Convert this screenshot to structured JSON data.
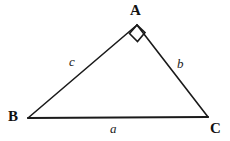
{
  "figure": {
    "kind": "right-triangle-diagram",
    "background_color": "#ffffff",
    "stroke_color": "#1a1a1a",
    "label_color": "#111111",
    "width": 230,
    "height": 141,
    "vertices": [
      {
        "name": "A",
        "label": "A",
        "x": 137,
        "y": 25,
        "angle": "right"
      },
      {
        "name": "B",
        "label": "B",
        "x": 28,
        "y": 118,
        "angle": "acute"
      },
      {
        "name": "C",
        "label": "C",
        "x": 208,
        "y": 117,
        "angle": "acute"
      }
    ],
    "sides": [
      {
        "name": "a",
        "label": "a",
        "from": "B",
        "to": "C",
        "role": "hypotenuse",
        "stroke_width": 2.2
      },
      {
        "name": "b",
        "label": "b",
        "from": "A",
        "to": "C",
        "role": "leg",
        "stroke_width": 1.6
      },
      {
        "name": "c",
        "label": "c",
        "from": "B",
        "to": "A",
        "role": "leg",
        "stroke_width": 1.6
      }
    ],
    "right_angle_marker": {
      "at_vertex": "A",
      "shape": "square",
      "orientation": "diamond",
      "size": 11,
      "stroke_width": 1.6
    }
  }
}
